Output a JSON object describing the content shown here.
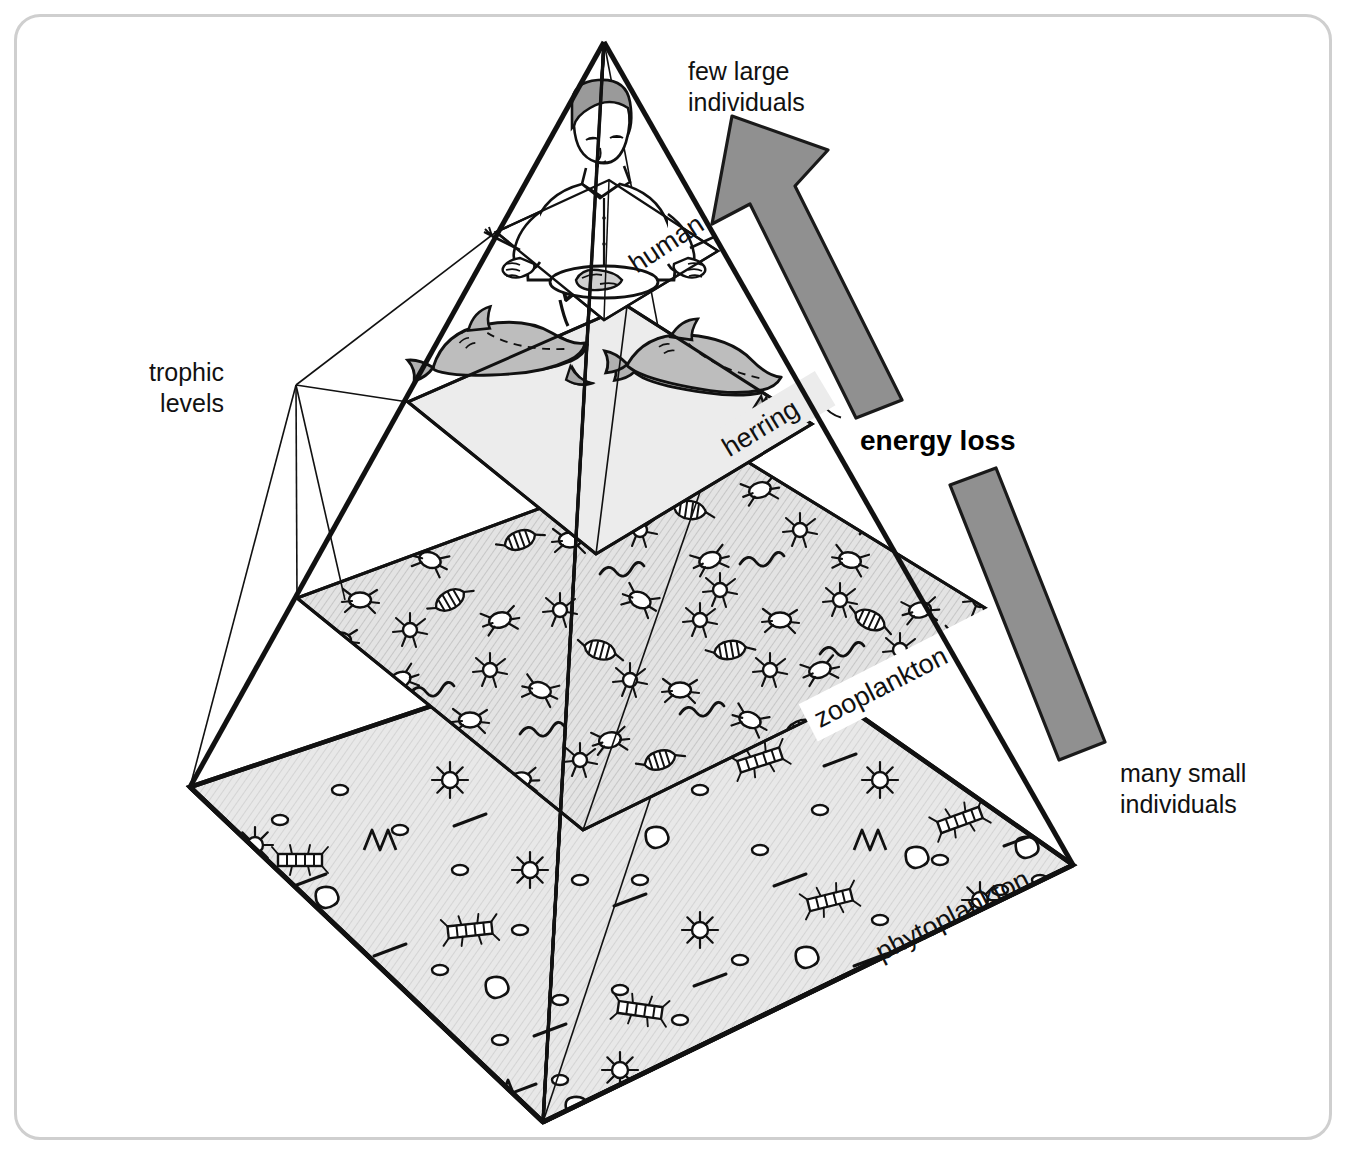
{
  "diagram": {
    "frame": {
      "border_color": "#cfcfcf",
      "background": "#ffffff"
    }
  },
  "callouts": {
    "top_right_line1": "few large",
    "top_right_line2": "individuals",
    "bottom_right_line1": "many small",
    "bottom_right_line2": "individuals",
    "left_line1": "trophic",
    "left_line2": "levels",
    "energy_loss": "energy loss"
  },
  "trophic_levels": [
    {
      "id": "human",
      "label": "human",
      "order": 4,
      "size_rank": "few large individuals",
      "plane_fill": "#ffffff"
    },
    {
      "id": "herring",
      "label": "herring",
      "order": 3,
      "size_rank": "large",
      "plane_fill": "#ececec"
    },
    {
      "id": "zooplankton",
      "label": "zooplankton",
      "order": 2,
      "size_rank": "small",
      "plane_fill": "#dcdcdc"
    },
    {
      "id": "phytoplankton",
      "label": "phytoplankton",
      "order": 1,
      "size_rank": "many small individuals",
      "plane_fill": "#e2e2e2"
    }
  ],
  "colors": {
    "arrow_fill": "#909090",
    "arrow_stroke": "#1a1a1a",
    "ink": "#111111",
    "frame": "#cfcfcf",
    "plane_light": "#ececec",
    "plane_mid": "#dcdcdc",
    "fish_fill": "#bdbdbd",
    "hair_fill": "#9a9a9a"
  },
  "geometry": {
    "apex": [
      604,
      42
    ],
    "base_left": [
      190,
      787
    ],
    "base_front": [
      543,
      1122
    ],
    "base_right": [
      1073,
      865
    ],
    "base_back": [
      712,
      612
    ]
  }
}
